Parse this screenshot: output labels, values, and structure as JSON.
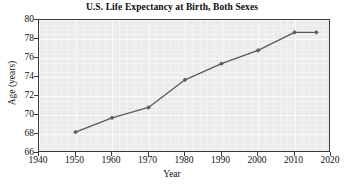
{
  "chart_data": {
    "type": "line",
    "title": "U.S. Life Expectancy at Birth, Both Sexes",
    "xlabel": "Year",
    "ylabel": "Age (years)",
    "xlim": [
      1940,
      2020
    ],
    "ylim": [
      66,
      80
    ],
    "xticks": [
      1940,
      1950,
      1960,
      1970,
      1980,
      1990,
      2000,
      2010,
      2020
    ],
    "yticks": [
      66,
      68,
      70,
      72,
      74,
      76,
      78,
      80
    ],
    "grid": true,
    "legend": null,
    "series": [
      {
        "name": "U.S. Life Expectancy",
        "x": [
          1950,
          1960,
          1970,
          1980,
          1990,
          2000,
          2010,
          2016
        ],
        "values": [
          68.2,
          69.7,
          70.8,
          73.7,
          75.4,
          76.8,
          78.7,
          78.7
        ],
        "marker": "diamond",
        "color": "#5a5a5a"
      }
    ],
    "style": {
      "plot_background": "#ebebeb",
      "gridline_color": "#fbfbfb",
      "frame_color": "#3a3a3a",
      "line_color": "#5a5a5a",
      "text_color": "#0f0f0f"
    }
  }
}
